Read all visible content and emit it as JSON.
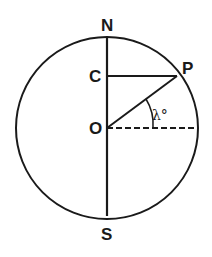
{
  "diagram": {
    "type": "geometry",
    "labels": {
      "north": "N",
      "south": "S",
      "center": "O",
      "c_point": "C",
      "p_point": "P",
      "angle": "λ°"
    },
    "colors": {
      "stroke": "#1a1a1a",
      "background": "#ffffff"
    }
  }
}
